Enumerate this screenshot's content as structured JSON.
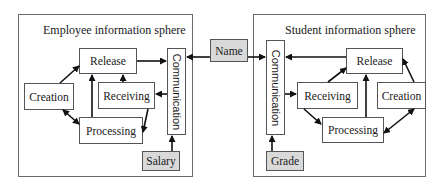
{
  "left_sphere": {
    "title": "Employee information sphere",
    "nodes": {
      "release": "Release",
      "creation": "Creation",
      "receiving": "Receiving",
      "processing": "Processing",
      "communication": "Communication",
      "input": "Salary"
    }
  },
  "shared": {
    "name": "Name"
  },
  "right_sphere": {
    "title": "Student information sphere",
    "nodes": {
      "release": "Release",
      "creation": "Creation",
      "receiving": "Receiving",
      "processing": "Processing",
      "communication": "Communication",
      "input": "Grade"
    }
  },
  "colors": {
    "border": "#555555",
    "shaded_fill": "#d9d9d9",
    "arrow": "#111111"
  }
}
